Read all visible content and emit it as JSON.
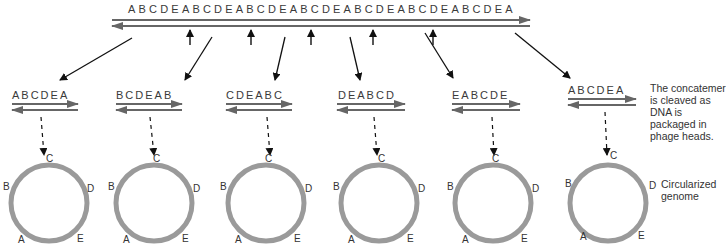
{
  "concatemer": {
    "sequence": "ABCDEABCDEABCDEABCDEABCDEABCDEABCDEA"
  },
  "fragments": [
    {
      "sequence": "ABCDEA",
      "x": 10,
      "circle": {
        "top": "C",
        "left": "B",
        "right": "D",
        "bl": "A",
        "br": "E"
      }
    },
    {
      "sequence": "BCDEAB",
      "x": 115,
      "circle": {
        "top": "C",
        "left": "B",
        "right": "D",
        "bl": "A",
        "br": "E"
      }
    },
    {
      "sequence": "CDEABC",
      "x": 226,
      "circle": {
        "top": "C",
        "left": "B",
        "right": "D",
        "bl": "A",
        "br": "E"
      }
    },
    {
      "sequence": "DEABCD",
      "x": 338,
      "circle": {
        "top": "C",
        "left": "B",
        "right": "D",
        "bl": "A",
        "br": "E"
      }
    },
    {
      "sequence": "EABCDE",
      "x": 452,
      "circle": {
        "top": "C",
        "left": "B",
        "right": "D",
        "bl": "A",
        "br": "E"
      }
    },
    {
      "sequence": "ABCDEA",
      "x": 568,
      "circle": {
        "top": "C",
        "left": "B",
        "right": "D",
        "bl": "A",
        "br": "E"
      }
    }
  ],
  "annotations": {
    "cleavage_note": "The concatemer is cleaved as DNA is packaged in phage heads.",
    "circle_note": "Circularized genome"
  },
  "colors": {
    "strand": "#666666",
    "circle": "#9a9a9a",
    "arrow": "#111111"
  }
}
